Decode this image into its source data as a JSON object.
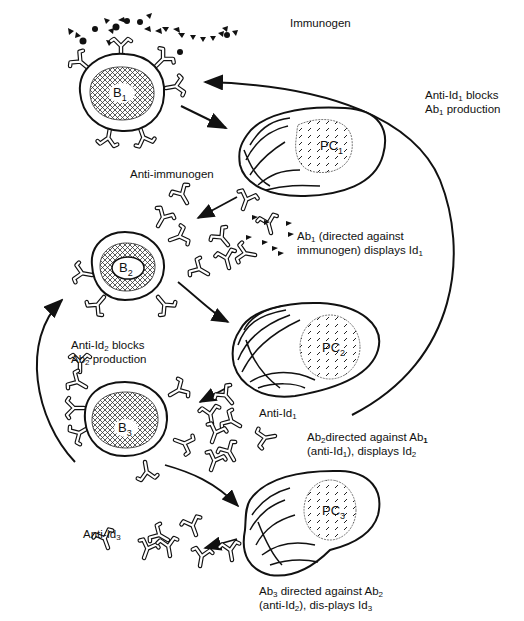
{
  "diagram": {
    "colors": {
      "ink": "#111111",
      "background": "#ffffff"
    },
    "cells": [
      {
        "id": "B1",
        "type": "B-cell",
        "label": "B",
        "sub": "1"
      },
      {
        "id": "PC1",
        "type": "plasma-cell",
        "label": "PC",
        "sub": "1"
      },
      {
        "id": "B2",
        "type": "B-cell",
        "label": "B",
        "sub": "2"
      },
      {
        "id": "PC2",
        "type": "plasma-cell",
        "label": "PC",
        "sub": "2"
      },
      {
        "id": "B3",
        "type": "B-cell",
        "label": "B",
        "sub": "3"
      },
      {
        "id": "PC3",
        "type": "plasma-cell",
        "label": "PC",
        "sub": "3"
      }
    ],
    "labels": {
      "immunogen": "Immunogen",
      "anti_immunogen": "Anti-immunogen",
      "ab1_line1_pre": "Ab",
      "ab1_line1_sub": "1",
      "ab1_line1_post": " (directed against",
      "ab1_line2_pre": "immunogen) displays Id",
      "ab1_line2_sub": "1",
      "block1_l1_pre": "Anti-Id",
      "block1_l1_sub": "1",
      "block1_l1_post": " blocks",
      "block1_l2_pre": "Ab",
      "block1_l2_sub": "1",
      "block1_l2_post": " production",
      "block2_l1_pre": "Anti-Id",
      "block2_l1_sub": "2",
      "block2_l1_post": " blocks",
      "block2_l2_pre": "Ab",
      "block2_l2_sub": "2",
      "block2_l2_post": " production",
      "anti_id1_pre": "Anti-Id",
      "anti_id1_sub": "1",
      "ab2_l1_pre": "Ab",
      "ab2_l1_sub": "2",
      "ab2_l1_mid": "directed against Ab",
      "ab2_l1_sub2": "1",
      "ab2_l2_pre": "(anti-Id",
      "ab2_l2_sub": "1",
      "ab2_l2_mid": "), displays Id",
      "ab2_l2_sub2": "2",
      "anti_id3_pre": "Anti-Id",
      "anti_id3_sub": "3",
      "ab3_l1_pre": "Ab",
      "ab3_l1_sub": "3",
      "ab3_l1_mid": " directed against Ab",
      "ab3_l1_sub2": "2",
      "ab3_l2_pre": "(anti-Id",
      "ab3_l2_sub": "2",
      "ab3_l2_mid": "), dis-plays Id",
      "ab3_l2_sub2": "3"
    }
  }
}
